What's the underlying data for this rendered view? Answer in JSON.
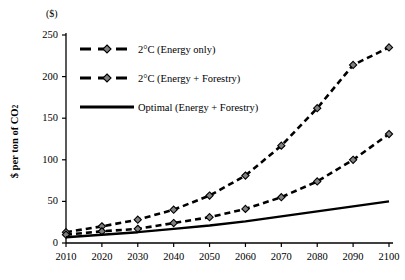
{
  "chart_data": {
    "type": "line",
    "title": "",
    "subtitle": "",
    "xlabel": "",
    "ylabel": "$ per ton of CO2",
    "unit_label": "($)",
    "x": [
      2010,
      2020,
      2030,
      2040,
      2050,
      2060,
      2070,
      2080,
      2090,
      2100
    ],
    "categories": [
      "2010",
      "2020",
      "2030",
      "2040",
      "2050",
      "2060",
      "2070",
      "2080",
      "2090",
      "2100"
    ],
    "xlim": [
      2005,
      2105
    ],
    "ylim": [
      0,
      250
    ],
    "yticks": [
      0,
      50,
      100,
      150,
      200,
      250
    ],
    "ytick_labels": [
      "0",
      "50",
      "100",
      "150",
      "200",
      "250"
    ],
    "xticks": [
      2010,
      2020,
      2030,
      2040,
      2050,
      2060,
      2070,
      2080,
      2090,
      2100
    ],
    "grid": false,
    "legend_position": "upper-left-inside",
    "series": [
      {
        "name": "2°C (Energy only)",
        "style": "dashed",
        "marker": "diamond",
        "color": "#000000",
        "marker_color": "#808080",
        "values": [
          13,
          20,
          28,
          40,
          57,
          81,
          117,
          162,
          214,
          235
        ]
      },
      {
        "name": "2°C (Energy + Forestry)",
        "style": "dashed",
        "marker": "diamond",
        "color": "#000000",
        "marker_color": "#808080",
        "values": [
          10,
          14,
          17,
          24,
          31,
          41,
          55,
          74,
          100,
          131
        ]
      },
      {
        "name": "Optimal (Energy + Forestry)",
        "style": "solid",
        "marker": "none",
        "color": "#000000",
        "marker_color": "#000000",
        "values": [
          7,
          10,
          13,
          17,
          21,
          26,
          32,
          38,
          44,
          50
        ]
      }
    ]
  },
  "legend": {
    "items": [
      {
        "label": "2°C (Energy only)"
      },
      {
        "label": "2°C (Energy + Forestry)"
      },
      {
        "label": "Optimal (Energy + Forestry)"
      }
    ]
  },
  "axes": {
    "unit_label": "($)",
    "y_title_main": "$ per ton of CO",
    "y_title_sub": "2"
  }
}
